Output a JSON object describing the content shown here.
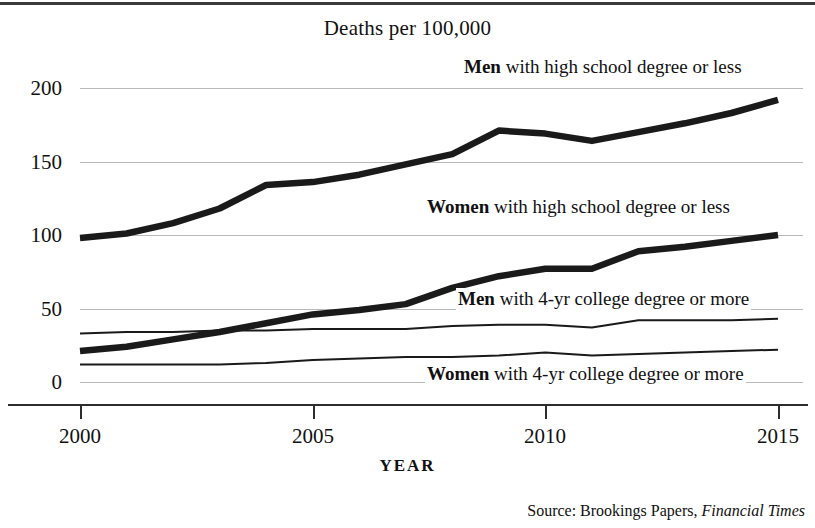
{
  "header": {
    "title": "Deaths per 100,000"
  },
  "footer": {
    "source_prefix": "Source:  Brookings Papers, ",
    "source_italic": "Financial Times"
  },
  "axes": {
    "x_title": "YEAR",
    "x_ticks": [
      "2000",
      "2005",
      "2010",
      "2015"
    ],
    "y_ticks": [
      "0",
      "50",
      "100",
      "150",
      "200"
    ]
  },
  "series_labels": {
    "men_hs_bold": "Men",
    "men_hs_rest": " with high school degree or less",
    "women_hs_bold": "Women",
    "women_hs_rest": " with high school degree or less",
    "men_col_bold": "Men",
    "men_col_rest": " with 4-yr college degree or more",
    "women_col_bold": "Women",
    "women_col_rest": " with 4-yr college degree or more"
  },
  "colors": {
    "line": "#1a1a1a",
    "grid": "#b9b9b9",
    "axis": "#2d2d2d",
    "background": "#ffffff"
  },
  "chart_data": {
    "type": "line",
    "title": "Deaths per 100,000",
    "xlabel": "YEAR",
    "ylabel": "",
    "xlim": [
      2000,
      2015
    ],
    "ylim": [
      0,
      200
    ],
    "yticks": [
      0,
      50,
      100,
      150,
      200
    ],
    "xticks": [
      2000,
      2005,
      2010,
      2015
    ],
    "grid": "horizontal",
    "legend": "inline-labels",
    "x": [
      2000,
      2001,
      2002,
      2003,
      2004,
      2005,
      2006,
      2007,
      2008,
      2009,
      2010,
      2011,
      2012,
      2013,
      2014,
      2015
    ],
    "series": [
      {
        "name": "Men with high school degree or less",
        "style": "thick",
        "values": [
          98,
          101,
          108,
          118,
          134,
          136,
          141,
          148,
          155,
          171,
          169,
          164,
          170,
          176,
          183,
          192
        ]
      },
      {
        "name": "Women with high school degree or less",
        "style": "thick",
        "values": [
          21,
          24,
          29,
          34,
          40,
          46,
          49,
          53,
          64,
          72,
          77,
          77,
          89,
          92,
          96,
          100
        ]
      },
      {
        "name": "Men with 4-yr college degree or more",
        "style": "thin",
        "values": [
          33,
          34,
          34,
          35,
          35,
          36,
          36,
          36,
          38,
          39,
          39,
          37,
          42,
          42,
          42,
          43
        ]
      },
      {
        "name": "Women with 4-yr college degree or more",
        "style": "thin",
        "values": [
          12,
          12,
          12,
          12,
          13,
          15,
          16,
          17,
          17,
          18,
          20,
          18,
          19,
          20,
          21,
          22
        ]
      }
    ]
  }
}
